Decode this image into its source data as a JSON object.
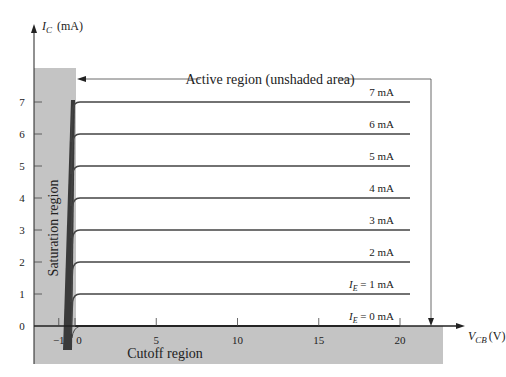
{
  "chart_data": {
    "type": "line",
    "title": "",
    "xlabel": "V_CB (V)",
    "ylabel": "I_C (mA)",
    "xlabel_main": "V",
    "xlabel_sub": "CB",
    "xlabel_unit": "(V)",
    "ylabel_main": "I",
    "ylabel_sub": "C",
    "ylabel_unit": "(mA)",
    "xlim": [
      -1,
      20
    ],
    "ylim": [
      0,
      7
    ],
    "x_ticks": [
      -1,
      0,
      5,
      10,
      15,
      20
    ],
    "y_ticks": [
      0,
      1,
      2,
      3,
      4,
      5,
      6,
      7
    ],
    "x_tick_labels": [
      "−1",
      "0",
      "5",
      "10",
      "15",
      "20"
    ],
    "y_tick_labels": [
      "0",
      "1",
      "2",
      "3",
      "4",
      "5",
      "6",
      "7"
    ],
    "grid": false,
    "series": [
      {
        "name": "I_E = 0 mA",
        "label": "0 mA",
        "prefix": "I",
        "sub": "E",
        "ic": 0,
        "x": [
          0,
          20
        ],
        "values": [
          0,
          0
        ]
      },
      {
        "name": "I_E = 1 mA",
        "label": "1 mA",
        "prefix": "I",
        "sub": "E",
        "ic": 1,
        "x": [
          -0.3,
          0.2,
          20.5
        ],
        "values": [
          0,
          1,
          1
        ]
      },
      {
        "name": "2 mA",
        "label": "2 mA",
        "ic": 2,
        "x": [
          -0.3,
          0.2,
          20.5
        ],
        "values": [
          0,
          2,
          2
        ]
      },
      {
        "name": "3 mA",
        "label": "3  mA",
        "ic": 3,
        "x": [
          -0.3,
          0.2,
          20.5
        ],
        "values": [
          0,
          3,
          3
        ]
      },
      {
        "name": "4 mA",
        "label": "4  mA",
        "ic": 4,
        "x": [
          -0.3,
          0.2,
          20.5
        ],
        "values": [
          0,
          4,
          4
        ]
      },
      {
        "name": "5 mA",
        "label": "5  mA",
        "ic": 5,
        "x": [
          -0.3,
          0.2,
          20.5
        ],
        "values": [
          0,
          5,
          5
        ]
      },
      {
        "name": "6 mA",
        "label": "6  mA",
        "ic": 6,
        "x": [
          -0.3,
          0.2,
          20.5
        ],
        "values": [
          0,
          6,
          6
        ]
      },
      {
        "name": "7 mA",
        "label": "7  mA",
        "ic": 7,
        "x": [
          -0.3,
          0.2,
          20.5
        ],
        "values": [
          0,
          7,
          7
        ]
      }
    ],
    "annotations": {
      "active_region": "Active region (unshaded area)",
      "saturation_region": "Saturation region",
      "cutoff_region": "Cutoff region"
    },
    "colors": {
      "shade": "#c4c4c4",
      "saturation_bar": "#3a3a3a",
      "curve": "#444444",
      "axis": "#222222"
    }
  }
}
